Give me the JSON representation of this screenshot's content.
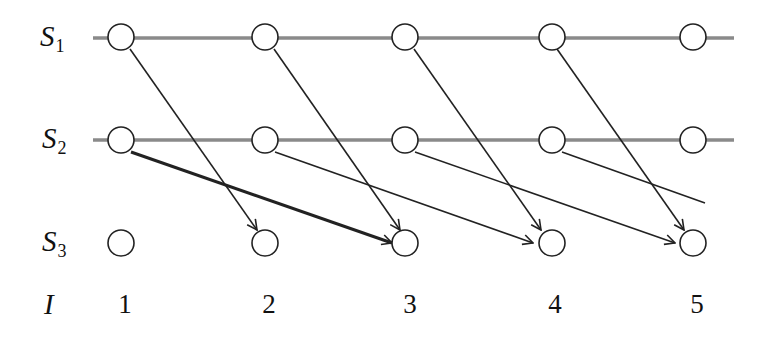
{
  "rows": [
    {
      "label": "S",
      "sub": "1"
    },
    {
      "label": "S",
      "sub": "2"
    },
    {
      "label": "S",
      "sub": "3"
    }
  ],
  "index_label": "I",
  "indices": [
    "1",
    "2",
    "3",
    "4",
    "5"
  ],
  "colors": {
    "line": "#888888",
    "stroke": "#222222"
  }
}
